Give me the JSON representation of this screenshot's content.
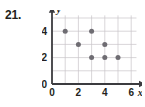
{
  "problem": {
    "number": "21."
  },
  "chart_data": {
    "type": "scatter",
    "title": "",
    "xlabel": "x",
    "ylabel": "y",
    "xlim": [
      0,
      6.4
    ],
    "ylim": [
      0,
      5.2
    ],
    "grid": true,
    "legend": null,
    "x_ticks": [
      "0",
      "2",
      "4",
      "6"
    ],
    "x_tick_values": [
      0,
      2,
      4,
      6
    ],
    "y_ticks": [
      "0",
      "2",
      "4"
    ],
    "y_tick_values": [
      0,
      2,
      4
    ],
    "x_gridlines": [
      1,
      2,
      3,
      4,
      5,
      6
    ],
    "y_gridlines": [
      1,
      2,
      3,
      4,
      5
    ],
    "points": [
      {
        "x": 1,
        "y": 4
      },
      {
        "x": 3,
        "y": 4
      },
      {
        "x": 2,
        "y": 3
      },
      {
        "x": 4,
        "y": 3
      },
      {
        "x": 3,
        "y": 2
      },
      {
        "x": 4,
        "y": 2
      },
      {
        "x": 5,
        "y": 2
      }
    ],
    "point_color": "#6e6c72",
    "grid_color": "#c8c4c8",
    "axis_color": "#3b3b3f"
  }
}
